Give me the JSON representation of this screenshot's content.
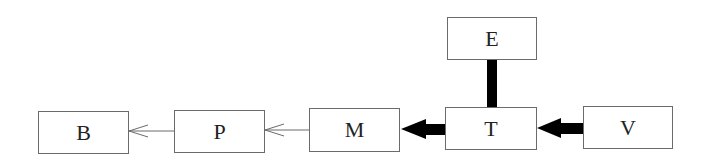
{
  "diagram": {
    "nodes": [
      {
        "id": "B",
        "label": "B"
      },
      {
        "id": "P",
        "label": "P"
      },
      {
        "id": "M",
        "label": "M"
      },
      {
        "id": "T",
        "label": "T"
      },
      {
        "id": "E",
        "label": "E"
      },
      {
        "id": "V",
        "label": "V"
      }
    ],
    "edges": [
      {
        "from": "P",
        "to": "B",
        "style": "thin-open-arrow"
      },
      {
        "from": "M",
        "to": "P",
        "style": "thin-open-arrow"
      },
      {
        "from": "T",
        "to": "M",
        "style": "thick-filled-arrow"
      },
      {
        "from": "V",
        "to": "T",
        "style": "thick-filled-arrow"
      },
      {
        "from": "E",
        "to": "T",
        "style": "thick-line"
      }
    ],
    "colors": {
      "stroke": "#6b6b6b",
      "thick": "#000000",
      "text": "#222222"
    }
  }
}
